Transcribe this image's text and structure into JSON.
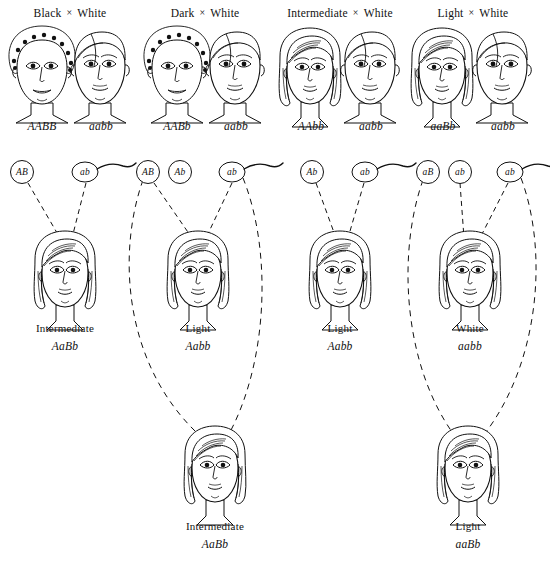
{
  "figure": {
    "title_row": [
      {
        "left": "Black",
        "operator": "×",
        "right": "White"
      },
      {
        "left": "Dark",
        "operator": "×",
        "right": "White"
      },
      {
        "left": "Intermediate",
        "operator": "×",
        "right": "White"
      },
      {
        "left": "Light",
        "operator": "×",
        "right": "White"
      }
    ],
    "colors": {
      "ink": "#111111",
      "skin_black": "#141414",
      "skin_dark": "#6e6e6e",
      "skin_intermediate": "#a0a0a0",
      "skin_light": "#bdbdbd",
      "skin_white": "#ffffff",
      "background": "#ffffff"
    },
    "crosses": [
      {
        "id": "cross-1",
        "header": {
          "left": "Black",
          "operator": "×",
          "right": "White"
        },
        "parents": [
          {
            "role": "father",
            "phenotype": "Black",
            "genotype": "AABB",
            "skin": "black",
            "sex": "male",
            "x": 42
          },
          {
            "role": "mother",
            "phenotype": "White",
            "genotype": "aabb",
            "skin": "white",
            "sex": "male",
            "x": 98
          }
        ],
        "gametes": [
          {
            "label": "AB",
            "type": "egg",
            "x": 22
          },
          {
            "label": "ab",
            "type": "sperm",
            "x": 85
          }
        ],
        "offspring": {
          "phenotype": "Intermediate",
          "genotype": "AaBb",
          "skin": "intermediate",
          "x": 65
        },
        "f2": null
      },
      {
        "id": "cross-2",
        "header": {
          "left": "Dark",
          "operator": "×",
          "right": "White"
        },
        "parents": [
          {
            "role": "father",
            "phenotype": "Dark",
            "genotype": "AABb",
            "skin": "dark",
            "sex": "male",
            "x": 177
          },
          {
            "role": "mother",
            "phenotype": "White",
            "genotype": "aabb",
            "skin": "white",
            "sex": "male",
            "x": 233
          }
        ],
        "gametes": [
          {
            "label": "AB",
            "type": "egg",
            "x": 148
          },
          {
            "label": "Ab",
            "type": "egg",
            "x": 180
          },
          {
            "label": "ab",
            "type": "sperm",
            "x": 232
          }
        ],
        "offspring": {
          "phenotype": "Light",
          "genotype": "Aabb",
          "skin": "light",
          "x": 198
        },
        "f2": {
          "phenotype": "Intermediate",
          "genotype": "AaBb",
          "skin": "intermediate",
          "x": 215
        }
      },
      {
        "id": "cross-3",
        "header": {
          "left": "Intermediate",
          "operator": "×",
          "right": "White"
        },
        "parents": [
          {
            "role": "father",
            "phenotype": "Intermediate",
            "genotype": "AAbb",
            "skin": "intermediate",
            "sex": "female",
            "x": 310
          },
          {
            "role": "mother",
            "phenotype": "White",
            "genotype": "aabb",
            "skin": "white",
            "sex": "male",
            "x": 368
          }
        ],
        "gametes": [
          {
            "label": "Ab",
            "type": "egg",
            "x": 312
          },
          {
            "label": "ab",
            "type": "sperm",
            "x": 365
          }
        ],
        "offspring": {
          "phenotype": "Light",
          "genotype": "Aabb",
          "skin": "light",
          "x": 340
        },
        "f2": null
      },
      {
        "id": "cross-4",
        "header": {
          "left": "Light",
          "operator": "×",
          "right": "White"
        },
        "parents": [
          {
            "role": "father",
            "phenotype": "Light",
            "genotype": "aaBb",
            "skin": "light",
            "sex": "female",
            "x": 442
          },
          {
            "role": "mother",
            "phenotype": "White",
            "genotype": "aabb",
            "skin": "white",
            "sex": "male",
            "x": 500
          }
        ],
        "gametes": [
          {
            "label": "aB",
            "type": "egg",
            "x": 428
          },
          {
            "label": "ab",
            "type": "egg",
            "x": 460
          },
          {
            "label": "ab",
            "type": "sperm",
            "x": 510
          }
        ],
        "offspring": {
          "phenotype": "White",
          "genotype": "aabb",
          "skin": "white",
          "x": 470
        },
        "f2": {
          "phenotype": "Light",
          "genotype": "aaBb",
          "skin": "light",
          "x": 468
        }
      }
    ]
  }
}
